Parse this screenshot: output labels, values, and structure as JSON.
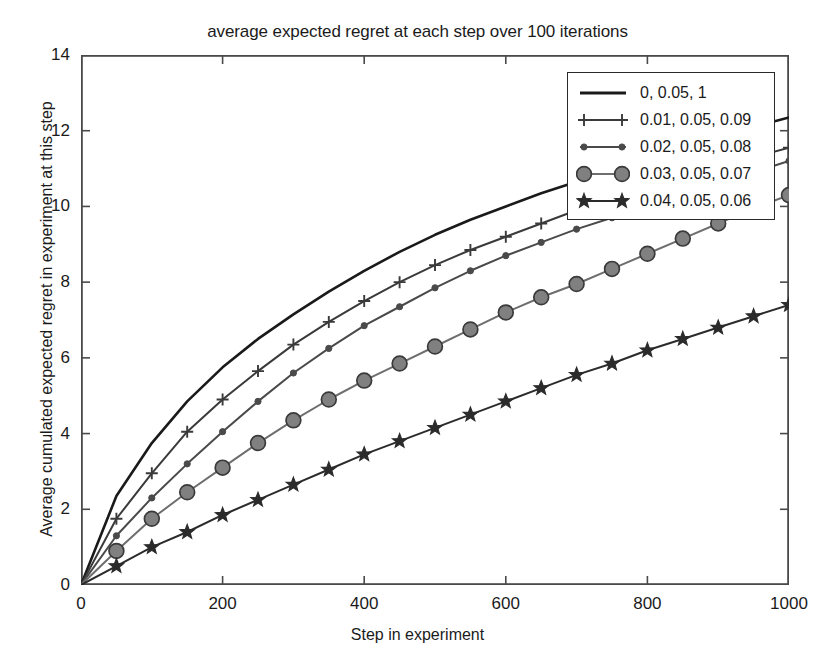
{
  "chart_data": {
    "type": "line",
    "title": "average expected regret at each step over 100 iterations",
    "xlabel": "Step in experiment",
    "ylabel": "Average cumulated expected regret in experiment at this step",
    "xlim": [
      0,
      1000
    ],
    "ylim": [
      0,
      14
    ],
    "xticks": [
      0,
      200,
      400,
      600,
      800,
      1000
    ],
    "yticks": [
      0,
      2,
      4,
      6,
      8,
      10,
      12,
      14
    ],
    "grid": false,
    "legend_position": "upper right",
    "marker_interval": 50,
    "x": [
      0,
      50,
      100,
      150,
      200,
      250,
      300,
      350,
      400,
      450,
      500,
      550,
      600,
      650,
      700,
      750,
      800,
      850,
      900,
      950,
      1000
    ],
    "series": [
      {
        "name": "0, 0.05, 1",
        "label": "0, 0.05, 1",
        "marker": "none",
        "color": "#1a1a1a",
        "values": [
          0,
          2.35,
          3.75,
          4.85,
          5.75,
          6.5,
          7.15,
          7.75,
          8.3,
          8.8,
          9.25,
          9.65,
          10.0,
          10.35,
          10.65,
          11.0,
          11.3,
          11.6,
          11.85,
          12.1,
          12.35
        ]
      },
      {
        "name": "0.01, 0.05, 0.09",
        "label": "0.01, 0.05, 0.09",
        "marker": "plus",
        "color": "#3a3a3a",
        "values": [
          0,
          1.75,
          2.95,
          4.05,
          4.9,
          5.65,
          6.35,
          6.95,
          7.5,
          8.0,
          8.45,
          8.85,
          9.2,
          9.55,
          9.9,
          10.2,
          10.5,
          10.8,
          11.05,
          11.3,
          11.55
        ]
      },
      {
        "name": "0.02, 0.05, 0.08",
        "label": "0.02, 0.05, 0.08",
        "marker": "dot",
        "color": "#4a4a4a",
        "values": [
          0,
          1.3,
          2.3,
          3.2,
          4.05,
          4.85,
          5.6,
          6.25,
          6.85,
          7.35,
          7.85,
          8.3,
          8.7,
          9.05,
          9.4,
          9.7,
          10.0,
          10.3,
          10.6,
          10.9,
          11.2
        ]
      },
      {
        "name": "0.03, 0.05, 0.07",
        "label": "0.03, 0.05, 0.07",
        "marker": "bigdot",
        "color": "#6e6e6e",
        "values": [
          0,
          0.9,
          1.75,
          2.45,
          3.1,
          3.75,
          4.35,
          4.9,
          5.4,
          5.85,
          6.3,
          6.75,
          7.2,
          7.6,
          7.95,
          8.35,
          8.75,
          9.15,
          9.55,
          9.95,
          10.3
        ]
      },
      {
        "name": "0.04, 0.05, 0.06",
        "label": "0.04, 0.05, 0.06",
        "marker": "star",
        "color": "#2b2b2b",
        "values": [
          0,
          0.5,
          1.0,
          1.4,
          1.85,
          2.25,
          2.65,
          3.05,
          3.45,
          3.8,
          4.15,
          4.5,
          4.85,
          5.2,
          5.55,
          5.85,
          6.2,
          6.5,
          6.8,
          7.1,
          7.4
        ]
      }
    ]
  }
}
